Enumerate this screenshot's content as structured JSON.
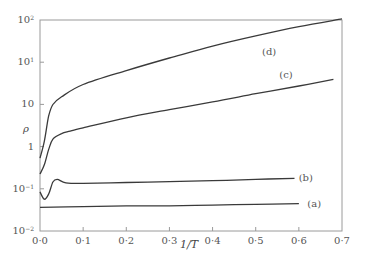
{
  "chart_data": {
    "type": "line",
    "title": "",
    "xlabel": "1/T",
    "ylabel": "ρ",
    "yscale": "log",
    "xlim": [
      0.0,
      0.7
    ],
    "ylim": [
      0.01,
      100
    ],
    "grid": false,
    "legend": "inline labels at curve ends",
    "x_ticks": [
      "0·0",
      "0·1",
      "0·2",
      "0·3",
      "0·4",
      "0·5",
      "0·6",
      "0·7"
    ],
    "y_ticks": [
      {
        "base": "10",
        "exp": "2"
      },
      {
        "base": "10",
        "exp": "1"
      },
      {
        "base": "10",
        "exp": ""
      },
      {
        "base": "1",
        "exp": ""
      },
      {
        "base": "10",
        "exp": "−1"
      },
      {
        "base": "10",
        "exp": "−2"
      }
    ],
    "series": [
      {
        "name": "(a)",
        "label_pos": [
          0.615,
          0.033
        ],
        "x": [
          0.0,
          0.1,
          0.2,
          0.3,
          0.4,
          0.5,
          0.6
        ],
        "y": [
          0.028,
          0.029,
          0.03,
          0.03,
          0.031,
          0.032,
          0.033
        ]
      },
      {
        "name": "(b)",
        "label_pos": [
          0.595,
          0.1
        ],
        "x": [
          0.0,
          0.01,
          0.02,
          0.03,
          0.04,
          0.06,
          0.1,
          0.2,
          0.3,
          0.4,
          0.5,
          0.59
        ],
        "y": [
          0.055,
          0.04,
          0.05,
          0.085,
          0.095,
          0.082,
          0.08,
          0.083,
          0.086,
          0.09,
          0.095,
          0.1
        ]
      },
      {
        "name": "(c)",
        "label_pos": [
          0.55,
          9.0
        ],
        "x": [
          0.0,
          0.01,
          0.02,
          0.03,
          0.05,
          0.07,
          0.1,
          0.2,
          0.3,
          0.4,
          0.5,
          0.6,
          0.68
        ],
        "y": [
          0.12,
          0.18,
          0.35,
          0.55,
          0.7,
          0.78,
          0.9,
          1.4,
          2.0,
          2.8,
          4.0,
          5.6,
          7.5
        ]
      },
      {
        "name": "(d)",
        "label_pos": [
          0.51,
          25.0
        ],
        "x": [
          0.0,
          0.01,
          0.02,
          0.03,
          0.05,
          0.1,
          0.2,
          0.3,
          0.4,
          0.5,
          0.6,
          0.7
        ],
        "y": [
          0.24,
          0.5,
          1.5,
          2.5,
          3.5,
          6.0,
          11.0,
          19.0,
          32.0,
          50.0,
          75.0,
          105.0
        ]
      }
    ]
  },
  "axes": {
    "x_label": "1/T",
    "y_label": "ρ"
  }
}
